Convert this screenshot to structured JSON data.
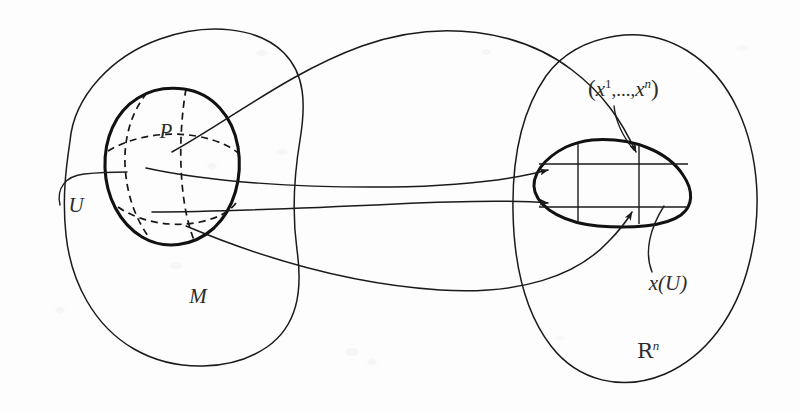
{
  "figure": {
    "background_color": "#fdfdfd",
    "ink_color": "#1a1a1a",
    "width": 800,
    "height": 413
  },
  "labels": {
    "manifold": "M",
    "patch": "U",
    "point": "P",
    "euclidean_space_base": "R",
    "euclidean_space_exponent": "n",
    "chart_image": "x(U)",
    "coordinates": {
      "open_paren": "(",
      "var": "x",
      "first_index": "1",
      "dots": ",...,",
      "last_var": "x",
      "last_index": "n",
      "close_paren": ")",
      "full": "(x1,...,xn)"
    }
  },
  "regions": [
    {
      "name": "manifold-region",
      "label": "M",
      "label_x": 198,
      "label_y": 303,
      "kind": "outer-blob",
      "side": "left"
    },
    {
      "name": "euclidean-region",
      "label": "Rn",
      "label_x": 652,
      "label_y": 358,
      "kind": "outer-blob",
      "side": "right"
    },
    {
      "name": "chart-patch",
      "label": "U",
      "label_x": 76,
      "label_y": 212,
      "kind": "patch",
      "side": "left"
    },
    {
      "name": "chart-image-blob",
      "label": "x(U)",
      "label_x": 668,
      "label_y": 290,
      "kind": "image-blob",
      "side": "right"
    }
  ],
  "annotations": [
    {
      "name": "point-label",
      "text": "P",
      "x": 166,
      "y": 138
    },
    {
      "name": "coordinate-tuple-label",
      "text": "(x1,...,xn)",
      "x": 588,
      "y": 96
    }
  ],
  "arrows": {
    "count": 4,
    "description": "mapping arrows from the patch U into x(U)"
  },
  "grid": {
    "patch_dashed_curves": 4,
    "image_vertical_lines": 2,
    "image_horizontal_lines": 2
  }
}
